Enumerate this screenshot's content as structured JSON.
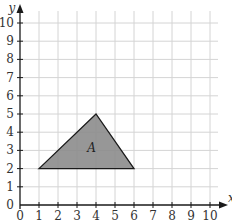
{
  "chart_data": {
    "type": "scatter",
    "title": "",
    "xlabel": "x",
    "ylabel": "y",
    "xlim": [
      0,
      10
    ],
    "ylim": [
      0,
      10
    ],
    "grid": true,
    "x_ticks": [
      "0",
      "1",
      "2",
      "3",
      "4",
      "5",
      "6",
      "7",
      "8",
      "9",
      "10"
    ],
    "y_ticks": [
      "0",
      "1",
      "2",
      "3",
      "4",
      "5",
      "6",
      "7",
      "8",
      "9",
      "10"
    ],
    "shapes": [
      {
        "name": "A",
        "kind": "triangle",
        "vertices": [
          [
            1,
            2
          ],
          [
            4,
            5
          ],
          [
            6,
            2
          ]
        ],
        "fill": "#8c8c8c",
        "stroke": "#1a1a1a"
      }
    ]
  },
  "colors": {
    "grid": "#d4d4d4",
    "axis": "#1a1a1a",
    "shape_fill": "#8c8c8c"
  }
}
